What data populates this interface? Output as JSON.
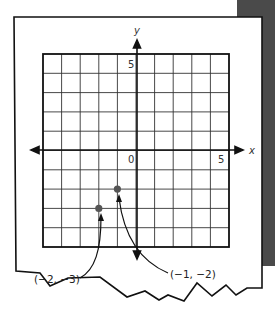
{
  "chart_data": {
    "type": "scatter",
    "title": "",
    "xlabel": "x",
    "ylabel": "y",
    "xlim": [
      -5,
      5
    ],
    "ylim": [
      -5,
      5
    ],
    "grid": true,
    "tick_labels": {
      "origin": "0",
      "x_max": "5",
      "y_max": "5"
    },
    "points": [
      {
        "x": -1,
        "y": -2,
        "label": "(−1, −2)"
      },
      {
        "x": -2,
        "y": -3,
        "label": "(−2, −3)"
      }
    ],
    "legend": null
  },
  "colors": {
    "paper": "#ffffff",
    "ink": "#111111",
    "grid_line": "#333333",
    "point": "#555555",
    "shadow": "#4a4a4a"
  }
}
